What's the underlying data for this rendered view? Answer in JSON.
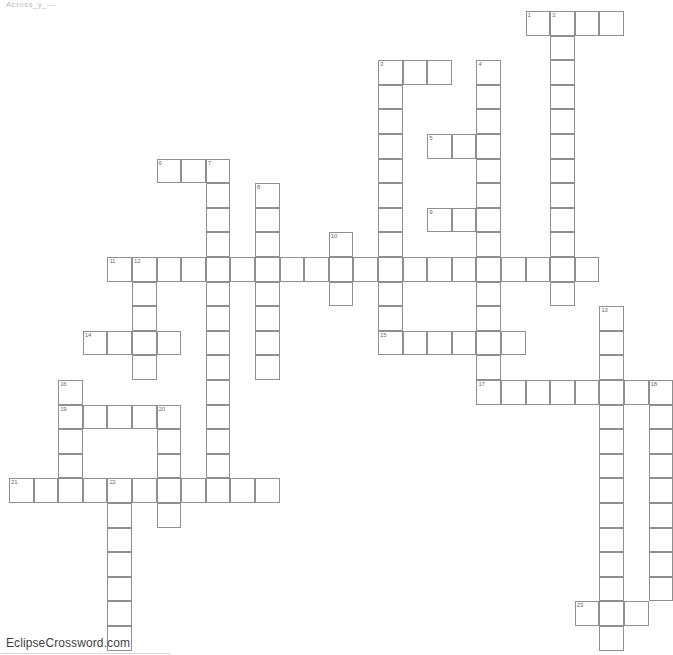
{
  "page": {
    "title_strip": "Across_y_---",
    "footer_credit": "EclipseCrossword.com",
    "background_color": "#ffffff",
    "cell_border_color": "#8f8f8f",
    "number_color": "#6d6d6d"
  },
  "grid": {
    "cell_size": 24.6,
    "origin_x": 9,
    "origin_y": 11,
    "columns": 27,
    "rows": 25
  },
  "chart_data": {
    "type": "table",
    "entries": [
      {
        "number": 1,
        "direction": "across",
        "col": 21,
        "row": 0,
        "length": 4
      },
      {
        "number": 2,
        "direction": "down",
        "col": 22,
        "row": 0,
        "length": 12
      },
      {
        "number": 3,
        "direction": "across",
        "col": 15,
        "row": 2,
        "length": 3
      },
      {
        "number": 3,
        "direction": "down",
        "col": 15,
        "row": 2,
        "length": 8
      },
      {
        "number": 4,
        "direction": "down",
        "col": 19,
        "row": 2,
        "length": 13
      },
      {
        "number": 5,
        "direction": "across",
        "col": 17,
        "row": 5,
        "length": 3
      },
      {
        "number": 6,
        "direction": "across",
        "col": 6,
        "row": 6,
        "length": 3
      },
      {
        "number": 7,
        "direction": "down",
        "col": 8,
        "row": 6,
        "length": 15
      },
      {
        "number": 8,
        "direction": "down",
        "col": 10,
        "row": 7,
        "length": 9
      },
      {
        "number": 9,
        "direction": "across",
        "col": 17,
        "row": 8,
        "length": 3
      },
      {
        "number": 10,
        "direction": "down",
        "col": 13,
        "row": 9,
        "length": 4
      },
      {
        "number": 11,
        "direction": "across",
        "col": 4,
        "row": 10,
        "length": 20
      },
      {
        "number": 12,
        "direction": "down",
        "col": 5,
        "row": 10,
        "length": 6
      },
      {
        "number": 13,
        "direction": "down",
        "col": 24,
        "row": 12,
        "length": 12
      },
      {
        "number": 14,
        "direction": "across",
        "col": 3,
        "row": 13,
        "length": 4
      },
      {
        "number": 15,
        "direction": "across",
        "col": 15,
        "row": 13,
        "length": 6
      },
      {
        "number": 16,
        "direction": "down",
        "col": 2,
        "row": 15,
        "length": 4
      },
      {
        "number": 17,
        "direction": "across",
        "col": 19,
        "row": 15,
        "length": 7
      },
      {
        "number": 18,
        "direction": "down",
        "col": 26,
        "row": 15,
        "length": 10
      },
      {
        "number": 19,
        "direction": "across",
        "col": 2,
        "row": 16,
        "length": 5
      },
      {
        "number": 20,
        "direction": "down",
        "col": 6,
        "row": 16,
        "length": 6
      },
      {
        "number": 21,
        "direction": "across",
        "col": 0,
        "row": 19,
        "length": 11
      },
      {
        "number": 22,
        "direction": "down",
        "col": 4,
        "row": 19,
        "length": 7
      },
      {
        "number": 23,
        "direction": "across",
        "col": 23,
        "row": 24,
        "length": 3
      }
    ],
    "cells": [
      {
        "col": 21,
        "row": 0,
        "num": 1
      },
      {
        "col": 22,
        "row": 0,
        "num": 2
      },
      {
        "col": 23,
        "row": 0
      },
      {
        "col": 24,
        "row": 0
      },
      {
        "col": 22,
        "row": 1
      },
      {
        "col": 22,
        "row": 2
      },
      {
        "col": 15,
        "row": 2,
        "num": 3
      },
      {
        "col": 16,
        "row": 2
      },
      {
        "col": 17,
        "row": 2
      },
      {
        "col": 19,
        "row": 2,
        "num": 4
      },
      {
        "col": 15,
        "row": 3
      },
      {
        "col": 19,
        "row": 3
      },
      {
        "col": 22,
        "row": 3
      },
      {
        "col": 15,
        "row": 4
      },
      {
        "col": 19,
        "row": 4
      },
      {
        "col": 22,
        "row": 4
      },
      {
        "col": 17,
        "row": 5,
        "num": 5
      },
      {
        "col": 18,
        "row": 5
      },
      {
        "col": 15,
        "row": 5
      },
      {
        "col": 19,
        "row": 5
      },
      {
        "col": 22,
        "row": 5
      },
      {
        "col": 6,
        "row": 6,
        "num": 6
      },
      {
        "col": 7,
        "row": 6
      },
      {
        "col": 8,
        "row": 6,
        "num": 7
      },
      {
        "col": 15,
        "row": 6
      },
      {
        "col": 19,
        "row": 6
      },
      {
        "col": 22,
        "row": 6
      },
      {
        "col": 8,
        "row": 7
      },
      {
        "col": 10,
        "row": 7,
        "num": 8
      },
      {
        "col": 15,
        "row": 7
      },
      {
        "col": 19,
        "row": 7
      },
      {
        "col": 22,
        "row": 7
      },
      {
        "col": 17,
        "row": 8,
        "num": 9
      },
      {
        "col": 18,
        "row": 8
      },
      {
        "col": 8,
        "row": 8
      },
      {
        "col": 10,
        "row": 8
      },
      {
        "col": 15,
        "row": 8
      },
      {
        "col": 19,
        "row": 8
      },
      {
        "col": 22,
        "row": 8
      },
      {
        "col": 8,
        "row": 9
      },
      {
        "col": 10,
        "row": 9
      },
      {
        "col": 13,
        "row": 9,
        "num": 10
      },
      {
        "col": 15,
        "row": 9
      },
      {
        "col": 19,
        "row": 9
      },
      {
        "col": 22,
        "row": 9
      },
      {
        "col": 4,
        "row": 10,
        "num": 11
      },
      {
        "col": 5,
        "row": 10,
        "num": 12
      },
      {
        "col": 6,
        "row": 10
      },
      {
        "col": 7,
        "row": 10
      },
      {
        "col": 8,
        "row": 10
      },
      {
        "col": 9,
        "row": 10
      },
      {
        "col": 10,
        "row": 10
      },
      {
        "col": 11,
        "row": 10
      },
      {
        "col": 12,
        "row": 10
      },
      {
        "col": 13,
        "row": 10
      },
      {
        "col": 14,
        "row": 10
      },
      {
        "col": 15,
        "row": 10
      },
      {
        "col": 16,
        "row": 10
      },
      {
        "col": 17,
        "row": 10
      },
      {
        "col": 18,
        "row": 10
      },
      {
        "col": 19,
        "row": 10
      },
      {
        "col": 20,
        "row": 10
      },
      {
        "col": 21,
        "row": 10
      },
      {
        "col": 22,
        "row": 10
      },
      {
        "col": 23,
        "row": 10
      },
      {
        "col": 5,
        "row": 11
      },
      {
        "col": 8,
        "row": 11
      },
      {
        "col": 10,
        "row": 11
      },
      {
        "col": 13,
        "row": 11
      },
      {
        "col": 15,
        "row": 11
      },
      {
        "col": 19,
        "row": 11
      },
      {
        "col": 22,
        "row": 11
      },
      {
        "col": 5,
        "row": 12
      },
      {
        "col": 8,
        "row": 12
      },
      {
        "col": 10,
        "row": 12
      },
      {
        "col": 15,
        "row": 12
      },
      {
        "col": 19,
        "row": 12
      },
      {
        "col": 24,
        "row": 12,
        "num": 13
      },
      {
        "col": 3,
        "row": 13,
        "num": 14
      },
      {
        "col": 4,
        "row": 13
      },
      {
        "col": 5,
        "row": 13
      },
      {
        "col": 6,
        "row": 13
      },
      {
        "col": 8,
        "row": 13
      },
      {
        "col": 10,
        "row": 13
      },
      {
        "col": 15,
        "row": 13,
        "num": 15
      },
      {
        "col": 16,
        "row": 13
      },
      {
        "col": 17,
        "row": 13
      },
      {
        "col": 18,
        "row": 13
      },
      {
        "col": 19,
        "row": 13
      },
      {
        "col": 20,
        "row": 13
      },
      {
        "col": 24,
        "row": 13
      },
      {
        "col": 5,
        "row": 14
      },
      {
        "col": 8,
        "row": 14
      },
      {
        "col": 10,
        "row": 14
      },
      {
        "col": 19,
        "row": 14
      },
      {
        "col": 24,
        "row": 14
      },
      {
        "col": 2,
        "row": 15,
        "num": 16
      },
      {
        "col": 8,
        "row": 15
      },
      {
        "col": 19,
        "row": 15,
        "num": 17
      },
      {
        "col": 20,
        "row": 15
      },
      {
        "col": 21,
        "row": 15
      },
      {
        "col": 22,
        "row": 15
      },
      {
        "col": 23,
        "row": 15
      },
      {
        "col": 24,
        "row": 15
      },
      {
        "col": 25,
        "row": 15
      },
      {
        "col": 26,
        "row": 15,
        "num": 18
      },
      {
        "col": 2,
        "row": 16,
        "num": 19
      },
      {
        "col": 3,
        "row": 16
      },
      {
        "col": 4,
        "row": 16
      },
      {
        "col": 5,
        "row": 16
      },
      {
        "col": 6,
        "row": 16,
        "num": 20
      },
      {
        "col": 8,
        "row": 16
      },
      {
        "col": 24,
        "row": 16
      },
      {
        "col": 26,
        "row": 16
      },
      {
        "col": 2,
        "row": 17
      },
      {
        "col": 6,
        "row": 17
      },
      {
        "col": 8,
        "row": 17
      },
      {
        "col": 24,
        "row": 17
      },
      {
        "col": 26,
        "row": 17
      },
      {
        "col": 2,
        "row": 18
      },
      {
        "col": 6,
        "row": 18
      },
      {
        "col": 8,
        "row": 18
      },
      {
        "col": 24,
        "row": 18
      },
      {
        "col": 26,
        "row": 18
      },
      {
        "col": 0,
        "row": 19,
        "num": 21
      },
      {
        "col": 1,
        "row": 19
      },
      {
        "col": 2,
        "row": 19
      },
      {
        "col": 3,
        "row": 19
      },
      {
        "col": 4,
        "row": 19,
        "num": 22
      },
      {
        "col": 5,
        "row": 19
      },
      {
        "col": 6,
        "row": 19
      },
      {
        "col": 7,
        "row": 19
      },
      {
        "col": 8,
        "row": 19
      },
      {
        "col": 9,
        "row": 19
      },
      {
        "col": 10,
        "row": 19
      },
      {
        "col": 24,
        "row": 19
      },
      {
        "col": 26,
        "row": 19
      },
      {
        "col": 4,
        "row": 20
      },
      {
        "col": 6,
        "row": 20
      },
      {
        "col": 24,
        "row": 20
      },
      {
        "col": 26,
        "row": 20
      },
      {
        "col": 4,
        "row": 21
      },
      {
        "col": 24,
        "row": 21
      },
      {
        "col": 26,
        "row": 21
      },
      {
        "col": 4,
        "row": 22
      },
      {
        "col": 24,
        "row": 22
      },
      {
        "col": 26,
        "row": 22
      },
      {
        "col": 4,
        "row": 23
      },
      {
        "col": 24,
        "row": 23
      },
      {
        "col": 26,
        "row": 23
      },
      {
        "col": 23,
        "row": 24,
        "num": 23
      },
      {
        "col": 24,
        "row": 24
      },
      {
        "col": 25,
        "row": 24
      },
      {
        "col": 4,
        "row": 24
      },
      {
        "col": 4,
        "row": 25
      },
      {
        "col": 24,
        "row": 25
      }
    ]
  }
}
